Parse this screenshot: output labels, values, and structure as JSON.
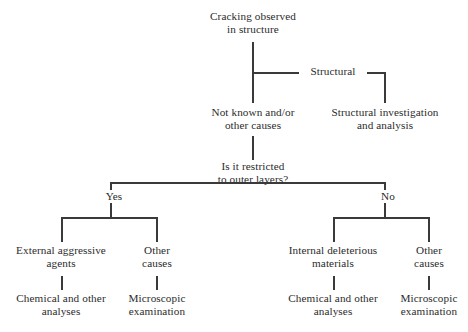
{
  "diagram": {
    "line_color": "#3a3a3a",
    "text_color": "#2b2b2b",
    "background_color": "#ffffff",
    "nodes": {
      "root": "Cracking observed\nin structure",
      "not_known": "Not known and/or\nother causes",
      "structural_investigation": "Structural investigation\nand analysis",
      "decision": "Is it restricted\nto outer layers?",
      "external_aggressive_agents": "External aggressive\nagents",
      "other_causes_left": "Other\ncauses",
      "chemical_analyses_left": "Chemical and other\nanalyses",
      "microscopic_exam_left": "Microscopic\nexamination",
      "internal_deleterious": "Internal deleterious\nmaterials",
      "other_causes_right": "Other\ncauses",
      "chemical_analyses_right": "Chemical and other\nanalyses",
      "microscopic_exam_right": "Microscopic\nexamination"
    },
    "edge_labels": {
      "structural": "Structural",
      "yes": "Yes",
      "no": "No"
    }
  }
}
